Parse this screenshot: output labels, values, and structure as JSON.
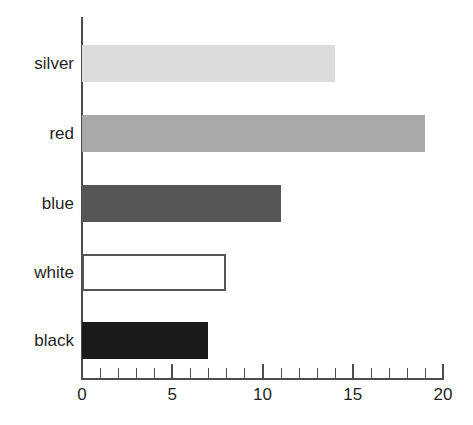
{
  "chart_data": {
    "type": "bar",
    "orientation": "horizontal",
    "title": "",
    "subtitle": "",
    "xlabel": "",
    "ylabel": "",
    "categories": [
      "silver",
      "red",
      "blue",
      "white",
      "black"
    ],
    "values": [
      14,
      19,
      11,
      8,
      7
    ],
    "series": [
      {
        "name": "",
        "values": [
          14,
          19,
          11,
          8,
          7
        ]
      }
    ],
    "xlim": [
      0,
      20
    ],
    "x_tick_labels": [
      "0",
      "5",
      "10",
      "15",
      "20"
    ],
    "x_major_ticks": [
      0,
      5,
      10,
      15,
      20
    ],
    "x_minor_tick_interval": 1,
    "grid": false,
    "legend": false,
    "legend_position": "none",
    "annotations": [],
    "bar_colors": [
      "#dcdcdc",
      "#a8a8a8",
      "#565656",
      "#ffffff",
      "#1a1a1a"
    ],
    "bar_border_colors": [
      "none",
      "none",
      "none",
      "#555555",
      "none"
    ],
    "bars": [
      {
        "category": "silver",
        "value": 14,
        "fill": "#dcdcdc",
        "border": "none"
      },
      {
        "category": "red",
        "value": 19,
        "fill": "#a8a8a8",
        "border": "none"
      },
      {
        "category": "blue",
        "value": 11,
        "fill": "#565656",
        "border": "none"
      },
      {
        "category": "white",
        "value": 8,
        "fill": "#ffffff",
        "border": "#555555"
      },
      {
        "category": "black",
        "value": 7,
        "fill": "#1a1a1a",
        "border": "none"
      }
    ]
  },
  "axes": {
    "axis_color": "#4d4d4d",
    "tick_color": "#4d4d4d",
    "label_color": "#1f1f1f"
  },
  "background": {
    "color": "#ffffff"
  }
}
